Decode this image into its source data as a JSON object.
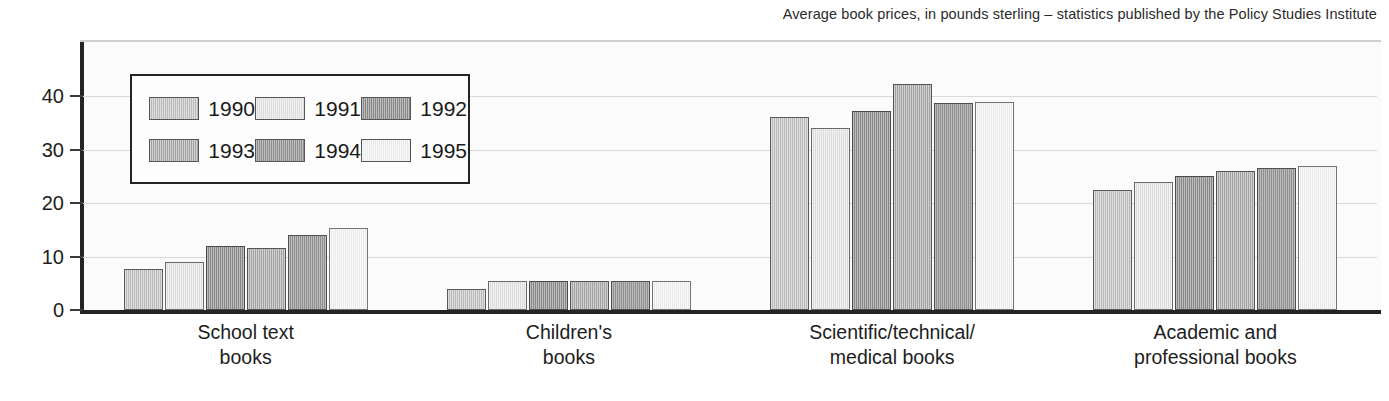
{
  "chart_data": {
    "type": "bar",
    "title": "Average book prices, in pounds sterling – statistics published by the Policy Studies Institute",
    "xlabel": "",
    "ylabel": "",
    "ylim": [
      0,
      46
    ],
    "yticks": [
      0,
      10,
      20,
      30,
      40
    ],
    "ytick_labels": [
      "0",
      "10",
      "20",
      "30",
      "40"
    ],
    "grid": true,
    "legend_position": "upper-left-inside",
    "categories": [
      "School text\nbooks",
      "Children's\nbooks",
      "Scientific/technical/\nmedical books",
      "Academic and\nprofessional books"
    ],
    "category_lines": [
      [
        "School text",
        "books"
      ],
      [
        "Children's",
        "books"
      ],
      [
        "Scientific/technical/",
        "medical books"
      ],
      [
        "Academic and",
        "professional books"
      ]
    ],
    "series": [
      {
        "name": "1990",
        "color": "#b9b9b9",
        "values": [
          7.6,
          4.0,
          36.0,
          22.5
        ]
      },
      {
        "name": "1991",
        "color": "#e2e2e2",
        "values": [
          9.0,
          5.5,
          34.0,
          24.0
        ]
      },
      {
        "name": "1992",
        "color": "#9a9a9a",
        "values": [
          12.0,
          5.5,
          37.2,
          25.0
        ]
      },
      {
        "name": "1993",
        "color": "#acacac",
        "values": [
          11.5,
          5.5,
          42.2,
          26.0
        ]
      },
      {
        "name": "1994",
        "color": "#9f9f9f",
        "values": [
          14.0,
          5.5,
          38.7,
          26.5
        ]
      },
      {
        "name": "1995",
        "color": "#ededed",
        "values": [
          15.3,
          5.5,
          38.8,
          27.0
        ]
      }
    ]
  },
  "legend": {
    "entries": [
      {
        "label": "1990"
      },
      {
        "label": "1991"
      },
      {
        "label": "1992"
      },
      {
        "label": "1993"
      },
      {
        "label": "1994"
      },
      {
        "label": "1995"
      }
    ]
  }
}
